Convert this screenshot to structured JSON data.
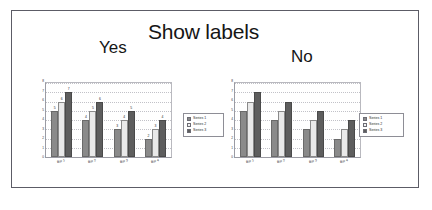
{
  "slide": {
    "title": "Show labels",
    "left_caption": "Yes",
    "right_caption": "No"
  },
  "colors": {
    "series1": "#8a8a8a",
    "series2": "#e9e9e9",
    "series3": "#5e5e5e",
    "frame": "#5c5c66",
    "grid": "#c2c2c8",
    "text": "#161616"
  },
  "legend": {
    "items": [
      {
        "label": "Series 1",
        "swatch": "series1"
      },
      {
        "label": "Series 2",
        "swatch": "series2"
      },
      {
        "label": "Series 3",
        "swatch": "series3"
      }
    ]
  },
  "chart_data": [
    {
      "id": "chart-with-labels",
      "type": "bar",
      "title": "",
      "xlabel": "",
      "ylabel": "",
      "ylim": [
        0,
        8
      ],
      "yticks": [
        0,
        1,
        2,
        3,
        4,
        5,
        6,
        7,
        8
      ],
      "grid": true,
      "legend_position": "right",
      "data_labels": true,
      "categories": [
        "Bar 1",
        "Bar 2",
        "Bar 3",
        "Bar 4"
      ],
      "series": [
        {
          "name": "Series 1",
          "values": [
            5,
            4,
            3,
            2
          ]
        },
        {
          "name": "Series 2",
          "values": [
            6,
            5,
            4,
            3
          ]
        },
        {
          "name": "Series 3",
          "values": [
            7,
            6,
            5,
            4
          ]
        }
      ]
    },
    {
      "id": "chart-without-labels",
      "type": "bar",
      "title": "",
      "xlabel": "",
      "ylabel": "",
      "ylim": [
        0,
        8
      ],
      "yticks": [
        0,
        1,
        2,
        3,
        4,
        5,
        6,
        7,
        8
      ],
      "grid": true,
      "legend_position": "right",
      "data_labels": false,
      "categories": [
        "Bar 1",
        "Bar 2",
        "Bar 3",
        "Bar 4"
      ],
      "series": [
        {
          "name": "Series 1",
          "values": [
            5,
            4,
            3,
            2
          ]
        },
        {
          "name": "Series 2",
          "values": [
            6,
            5,
            4,
            3
          ]
        },
        {
          "name": "Series 3",
          "values": [
            7,
            6,
            5,
            4
          ]
        }
      ]
    }
  ]
}
